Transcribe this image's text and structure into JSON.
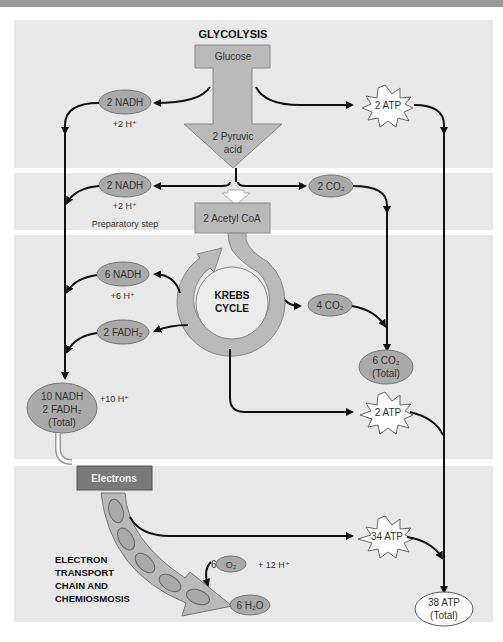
{
  "sections": {
    "glycolysis": {
      "title": "GLYCOLYSIS"
    },
    "preparatory": {
      "label": "Preparatory step"
    },
    "krebs": {
      "line1": "KREBS",
      "line2": "CYCLE"
    },
    "etc": {
      "line1": "ELECTRON",
      "line2": "TRANSPORT",
      "line3": "CHAIN AND",
      "line4": "CHEMIOSMOSIS"
    }
  },
  "nodes": {
    "glucose": "Glucose",
    "pyruvic_1": "2 Pyruvic",
    "pyruvic_2": "acid",
    "glyco_nadh": "2 NADH",
    "glyco_h": "+2 H⁺",
    "glyco_atp": "2 ATP",
    "prep_nadh": "2 NADH",
    "prep_h": "+2 H⁺",
    "prep_co2": "2 CO₂",
    "acetyl_coa": "2 Acetyl CoA",
    "krebs_nadh": "6 NADH",
    "krebs_h": "+6 H⁺",
    "krebs_fadh2": "2 FADH₂",
    "krebs_co2": "4 CO₂",
    "total_co2_1": "6 CO₂",
    "total_co2_2": "(Total)",
    "total_carriers_1": "10 NADH",
    "total_carriers_2": "2 FADH₂",
    "total_carriers_3": "(Total)",
    "total_h": "+10 H⁺",
    "krebs_atp": "2 ATP",
    "electrons": "Electrons",
    "etc_atp": "34 ATP",
    "o2_coef": "6",
    "o2": "O₂",
    "o2_h": "+ 12 H⁺",
    "water": "6 H₂O",
    "total_atp_1": "38 ATP",
    "total_atp_2": "(Total)"
  },
  "colors": {
    "panel": "#e8e8e8",
    "block_fill": "#b9b9b9",
    "ellipse_fill": "#a9a9a9",
    "electrons_box": "#7a7a7a",
    "line": "#111111"
  }
}
